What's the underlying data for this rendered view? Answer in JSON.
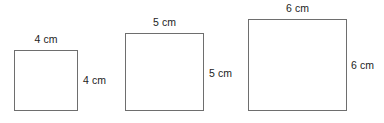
{
  "diagram": {
    "type": "geometry-squares",
    "background_color": "#ffffff",
    "stroke_color": "#6e6e6e",
    "text_color": "#1d1d1d",
    "figures": [
      {
        "name": "square-4cm",
        "top_label": "4 cm",
        "side_label": "4 cm",
        "side_length_cm": 4,
        "unit": "cm"
      },
      {
        "name": "square-5cm",
        "top_label": "5 cm",
        "side_label": "5 cm",
        "side_length_cm": 5,
        "unit": "cm"
      },
      {
        "name": "square-6cm",
        "top_label": "6 cm",
        "side_label": "6 cm",
        "side_length_cm": 6,
        "unit": "cm"
      }
    ]
  }
}
